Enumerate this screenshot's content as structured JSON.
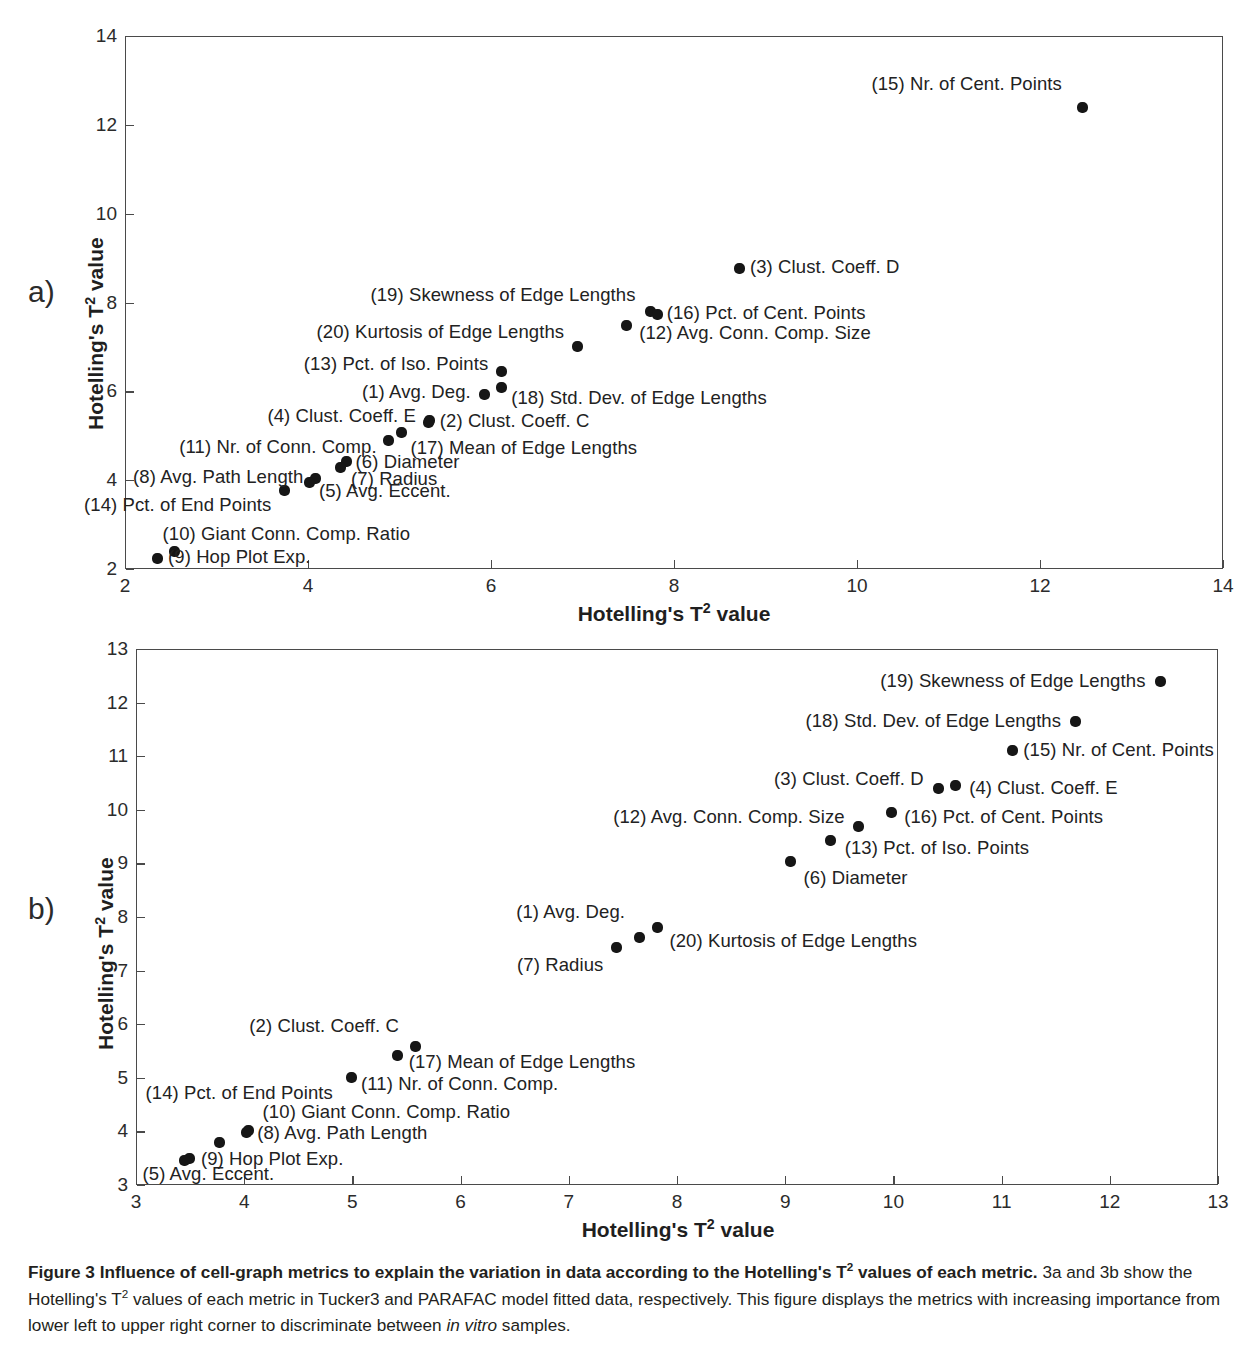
{
  "figure": {
    "panel_a_letter": "a)",
    "panel_b_letter": "b)",
    "caption_lead": "Figure 3 Influence of cell-graph metrics to explain the variation in data according to the Hotelling's T2 values of each metric.",
    "caption_rest_1": "3a and 3b show the Hotelling's T",
    "caption_rest_2": " values of each metric in Tucker3 and PARAFAC model fitted data, respectively. This figure displays the metrics with increasing importance from lower left to upper right corner to discriminate between ",
    "caption_italic": "in vitro",
    "caption_rest_3": " samples.",
    "axis_title_base": "Hotelling's T",
    "axis_title_exp": "2",
    "axis_title_tail": " value"
  },
  "chart_data": [
    {
      "type": "scatter",
      "panel": "a",
      "title": "Hotelling's T2 values of each metric — Tucker3 model",
      "xlabel": "Hotelling's T2 value",
      "ylabel": "Hotelling's T2 value",
      "xlim": [
        2,
        14
      ],
      "ylim": [
        2,
        14
      ],
      "xticks": [
        2,
        4,
        6,
        8,
        10,
        12,
        14
      ],
      "yticks": [
        2,
        4,
        6,
        8,
        10,
        12,
        14
      ],
      "grid": false,
      "legend": "none",
      "points": [
        {
          "id": 15,
          "label": "(15) Nr. of Cent. Points",
          "x": 12.46,
          "y": 12.38,
          "lx": 12.24,
          "ly": 12.92,
          "side": "r"
        },
        {
          "id": 3,
          "label": "(3) Clust. Coeff. D",
          "x": 8.72,
          "y": 8.76,
          "lx": 8.83,
          "ly": 8.8,
          "side": "l"
        },
        {
          "id": 19,
          "label": "(19) Skewness of Edge Lengths",
          "x": 7.74,
          "y": 7.8,
          "lx": 7.58,
          "ly": 8.16,
          "side": "r"
        },
        {
          "id": 16,
          "label": "(16) Pct. of Cent. Points",
          "x": 7.82,
          "y": 7.74,
          "lx": 7.92,
          "ly": 7.76,
          "side": "l"
        },
        {
          "id": 20,
          "label": "(20) Kurtosis of Edge Lengths",
          "x": 6.95,
          "y": 7.0,
          "lx": 6.8,
          "ly": 7.33,
          "side": "r"
        },
        {
          "id": 12,
          "label": "(12) Avg. Conn. Comp. Size",
          "x": 7.48,
          "y": 7.48,
          "lx": 7.62,
          "ly": 7.32,
          "side": "l"
        },
        {
          "id": 13,
          "label": "(13) Pct. of Iso. Points",
          "x": 6.12,
          "y": 6.44,
          "lx": 5.97,
          "ly": 6.62,
          "side": "r"
        },
        {
          "id": 1,
          "label": "(1) Avg. Deg.",
          "x": 5.93,
          "y": 5.93,
          "lx": 5.78,
          "ly": 5.99,
          "side": "r"
        },
        {
          "id": 18,
          "label": "(18) Std. Dev. of Edge Lengths",
          "x": 6.12,
          "y": 6.08,
          "lx": 6.22,
          "ly": 5.86,
          "side": "l"
        },
        {
          "id": 4,
          "label": "(4) Clust. Coeff. E",
          "x": 5.32,
          "y": 5.3,
          "lx": 5.18,
          "ly": 5.45,
          "side": "r"
        },
        {
          "id": 2,
          "label": "(2) Clust. Coeff. C",
          "x": 5.33,
          "y": 5.34,
          "lx": 5.44,
          "ly": 5.33,
          "side": "l"
        },
        {
          "id": 11,
          "label": "(11) Nr. of Conn. Comp.",
          "x": 4.88,
          "y": 4.89,
          "lx": 4.75,
          "ly": 4.74,
          "side": "r"
        },
        {
          "id": 17,
          "label": "(17) Mean of Edge Lengths",
          "x": 5.02,
          "y": 5.07,
          "lx": 5.12,
          "ly": 4.72,
          "side": "l"
        },
        {
          "id": 6,
          "label": "(6) Diameter",
          "x": 4.42,
          "y": 4.42,
          "lx": 4.52,
          "ly": 4.4,
          "side": "l"
        },
        {
          "id": 8,
          "label": "(8) Avg. Path Length",
          "x": 4.08,
          "y": 4.04,
          "lx": 3.95,
          "ly": 4.07,
          "side": "r"
        },
        {
          "id": 7,
          "label": "(7) Radius",
          "x": 4.35,
          "y": 4.28,
          "lx": 4.47,
          "ly": 4.02,
          "side": "l"
        },
        {
          "id": 5,
          "label": "(5) Avg. Eccent.",
          "x": 4.02,
          "y": 3.95,
          "lx": 4.12,
          "ly": 3.76,
          "side": "l"
        },
        {
          "id": 14,
          "label": "(14) Pct. of End Points",
          "x": 3.74,
          "y": 3.76,
          "lx": 3.6,
          "ly": 3.43,
          "side": "r"
        },
        {
          "id": 10,
          "label": "(10) Giant Conn. Comp. Ratio",
          "x": 2.54,
          "y": 2.4,
          "lx": 2.41,
          "ly": 2.78,
          "side": "l"
        },
        {
          "id": 9,
          "label": "(9) Hop Plot Exp.",
          "x": 2.36,
          "y": 2.24,
          "lx": 2.47,
          "ly": 2.26,
          "side": "l"
        }
      ]
    },
    {
      "type": "scatter",
      "panel": "b",
      "title": "Hotelling's T2 values of each metric — PARAFAC model",
      "xlabel": "Hotelling's T2 value",
      "ylabel": "Hotelling's T2 value",
      "xlim": [
        3,
        13
      ],
      "ylim": [
        3,
        13
      ],
      "xticks": [
        3,
        4,
        5,
        6,
        7,
        8,
        9,
        10,
        11,
        12,
        13
      ],
      "yticks": [
        3,
        4,
        5,
        6,
        7,
        8,
        9,
        10,
        11,
        12,
        13
      ],
      "grid": false,
      "legend": "none",
      "points": [
        {
          "id": 19,
          "label": "(19) Skewness of Edge Lengths",
          "x": 12.47,
          "y": 12.39,
          "lx": 12.33,
          "ly": 12.4,
          "side": "r"
        },
        {
          "id": 18,
          "label": "(18) Std. Dev. of Edge Lengths",
          "x": 11.68,
          "y": 11.65,
          "lx": 11.55,
          "ly": 11.66,
          "side": "r"
        },
        {
          "id": 15,
          "label": "(15) Nr. of Cent. Points",
          "x": 11.1,
          "y": 11.11,
          "lx": 11.2,
          "ly": 11.12,
          "side": "l"
        },
        {
          "id": 3,
          "label": "(3) Clust. Coeff. D",
          "x": 10.42,
          "y": 10.4,
          "lx": 10.28,
          "ly": 10.58,
          "side": "r"
        },
        {
          "id": 4,
          "label": "(4) Clust. Coeff. E",
          "x": 10.57,
          "y": 10.46,
          "lx": 10.7,
          "ly": 10.4,
          "side": "l"
        },
        {
          "id": 16,
          "label": "(16) Pct. of Cent. Points",
          "x": 9.98,
          "y": 9.95,
          "lx": 10.1,
          "ly": 9.86,
          "side": "l"
        },
        {
          "id": 12,
          "label": "(12) Avg. Conn. Comp. Size",
          "x": 9.68,
          "y": 9.68,
          "lx": 9.55,
          "ly": 9.87,
          "side": "r"
        },
        {
          "id": 13,
          "label": "(13) Pct. of Iso. Points",
          "x": 9.42,
          "y": 9.43,
          "lx": 9.55,
          "ly": 9.28,
          "side": "l"
        },
        {
          "id": 6,
          "label": "(6) Diameter",
          "x": 9.05,
          "y": 9.03,
          "lx": 9.17,
          "ly": 8.72,
          "side": "l"
        },
        {
          "id": 1,
          "label": "(1) Avg. Deg.",
          "x": 7.65,
          "y": 7.62,
          "lx": 7.52,
          "ly": 8.09,
          "side": "r"
        },
        {
          "id": 20,
          "label": "(20) Kurtosis of Edge Lengths",
          "x": 7.82,
          "y": 7.81,
          "lx": 7.93,
          "ly": 7.56,
          "side": "l"
        },
        {
          "id": 7,
          "label": "(7) Radius",
          "x": 7.44,
          "y": 7.44,
          "lx": 7.32,
          "ly": 7.1,
          "side": "r"
        },
        {
          "id": 2,
          "label": "(2) Clust. Coeff. C",
          "x": 5.58,
          "y": 5.59,
          "lx": 5.43,
          "ly": 5.96,
          "side": "r"
        },
        {
          "id": 17,
          "label": "(17) Mean of Edge Lengths",
          "x": 5.42,
          "y": 5.41,
          "lx": 5.52,
          "ly": 5.3,
          "side": "l"
        },
        {
          "id": 11,
          "label": "(11) Nr. of Conn. Comp.",
          "x": 4.99,
          "y": 5.01,
          "lx": 5.08,
          "ly": 4.88,
          "side": "l"
        },
        {
          "id": 10,
          "label": "(10) Giant Conn. Comp. Ratio",
          "x": 4.04,
          "y": 4.02,
          "lx": 4.17,
          "ly": 4.36,
          "side": "l"
        },
        {
          "id": 8,
          "label": "(8) Avg. Path Length",
          "x": 4.02,
          "y": 3.98,
          "lx": 4.12,
          "ly": 3.97,
          "side": "l"
        },
        {
          "id": 14,
          "label": "(14) Pct. of End Points",
          "x": 3.77,
          "y": 3.8,
          "lx": 4.82,
          "ly": 4.72,
          "side": "r"
        },
        {
          "id": 9,
          "label": "(9) Hop Plot Exp.",
          "x": 3.49,
          "y": 3.49,
          "lx": 3.6,
          "ly": 3.49,
          "side": "l"
        },
        {
          "id": 5,
          "label": "(5) Avg. Eccent.",
          "x": 3.45,
          "y": 3.46,
          "lx": 3.06,
          "ly": 3.2,
          "side": "l"
        }
      ]
    }
  ]
}
